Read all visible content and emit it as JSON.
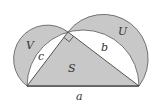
{
  "diagram": {
    "labels": {
      "V": "V",
      "U": "U",
      "S": "S",
      "a": "a",
      "b": "b",
      "c": "c"
    },
    "colors": {
      "shade": "#c8c8c8",
      "stroke": "#444444",
      "background": "#ffffff"
    }
  }
}
